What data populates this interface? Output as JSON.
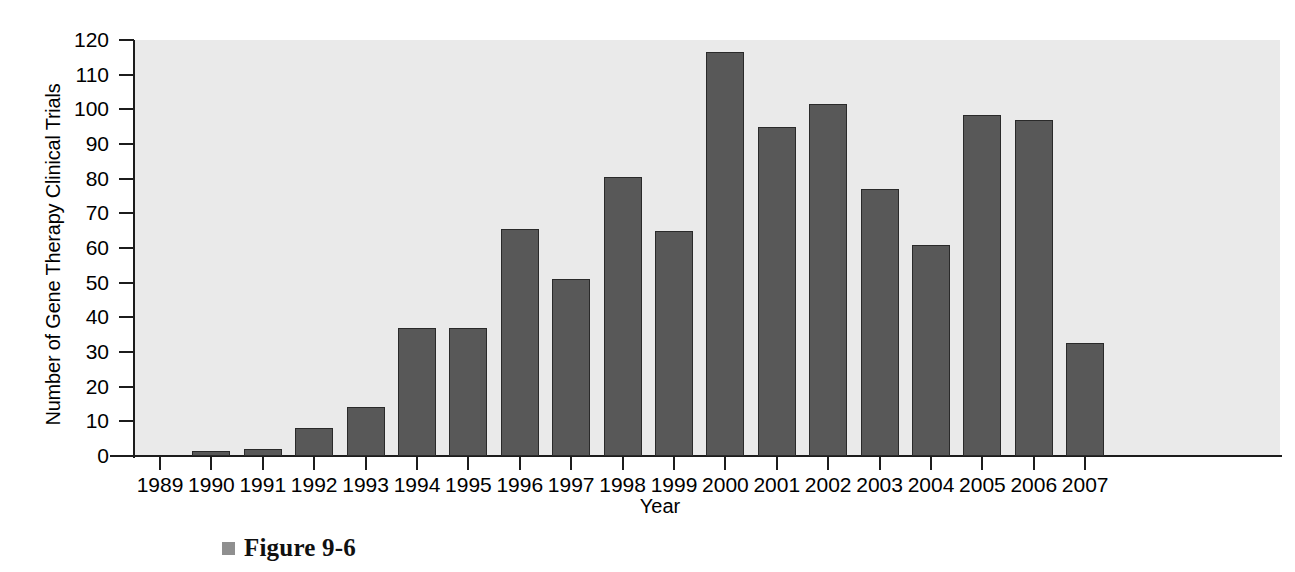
{
  "chart_data": {
    "type": "bar",
    "title": "",
    "xlabel": "Year",
    "ylabel": "Number of Gene Therapy Clinical Trials",
    "categories": [
      "1989",
      "1990",
      "1991",
      "1992",
      "1993",
      "1994",
      "1995",
      "1996",
      "1997",
      "1998",
      "1999",
      "2000",
      "2001",
      "2002",
      "2003",
      "2004",
      "2005",
      "2006",
      "2007"
    ],
    "values": [
      0,
      1.5,
      2,
      8,
      14,
      37,
      37,
      65.5,
      51,
      80.5,
      65,
      116.5,
      95,
      101.5,
      77,
      61,
      98.5,
      97,
      32.5
    ],
    "ylim": [
      0,
      120
    ],
    "yticks": [
      0,
      10,
      20,
      30,
      40,
      50,
      60,
      70,
      80,
      90,
      100,
      110,
      120
    ],
    "ytick_labels": [
      "0",
      "10",
      "20",
      "30",
      "40",
      "50",
      "60",
      "70",
      "80",
      "90",
      "100",
      "110",
      "120"
    ],
    "grid": false,
    "legend": "none",
    "bar_color": "#585858",
    "bar_edge_color": "#2a2a2a",
    "plot_background": "#eaeaea"
  },
  "caption": {
    "bullet": "square-bullet-icon",
    "text": "Figure 9-6"
  }
}
